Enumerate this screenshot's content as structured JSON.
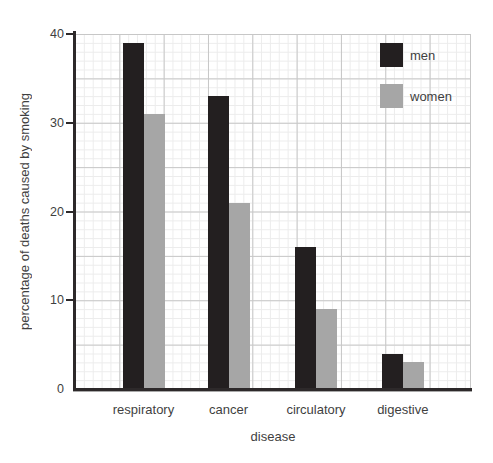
{
  "chart_data": {
    "type": "bar",
    "title": "",
    "xlabel": "disease",
    "ylabel": "percentage of deaths caused by smoking",
    "categories": [
      "respiratory",
      "cancer",
      "circulatory",
      "digestive"
    ],
    "series": [
      {
        "name": "men",
        "color": "#231f20",
        "values": [
          39,
          33,
          16,
          4
        ]
      },
      {
        "name": "women",
        "color": "#a6a6a6",
        "values": [
          31,
          21,
          9,
          3
        ]
      }
    ],
    "ylim": [
      0,
      40
    ],
    "yticks": [
      0,
      10,
      20,
      30,
      40
    ],
    "grid": {
      "minor_step": 1,
      "major_step": 5,
      "visible": true
    },
    "legend_position": "top-right-inside"
  },
  "colors": {
    "men": "#231f20",
    "women": "#a6a6a6",
    "axis": "#2d292a",
    "grid_major": "#c7c7c7",
    "grid_minor": "#ececec",
    "text": "#3f3f3f",
    "background": "#ffffff"
  }
}
